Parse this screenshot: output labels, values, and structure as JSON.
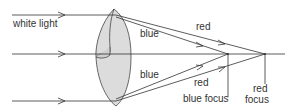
{
  "diagram": {
    "labels": {
      "input": "white light",
      "blue_upper": "blue",
      "blue_lower": "blue",
      "red_upper": "red",
      "red_lower": "red",
      "blue_focus": "blue focus",
      "red_focus_line1": "red",
      "red_focus_line2": "focus"
    },
    "colors": {
      "line": "#333333",
      "lens_fill": "#dcdcdc",
      "background": "#ffffff"
    },
    "geometry": {
      "axis_y": 54,
      "ray_top_y": 15,
      "ray_bottom_y": 101,
      "blue_focus_x": 228,
      "red_focus_x": 265
    }
  }
}
